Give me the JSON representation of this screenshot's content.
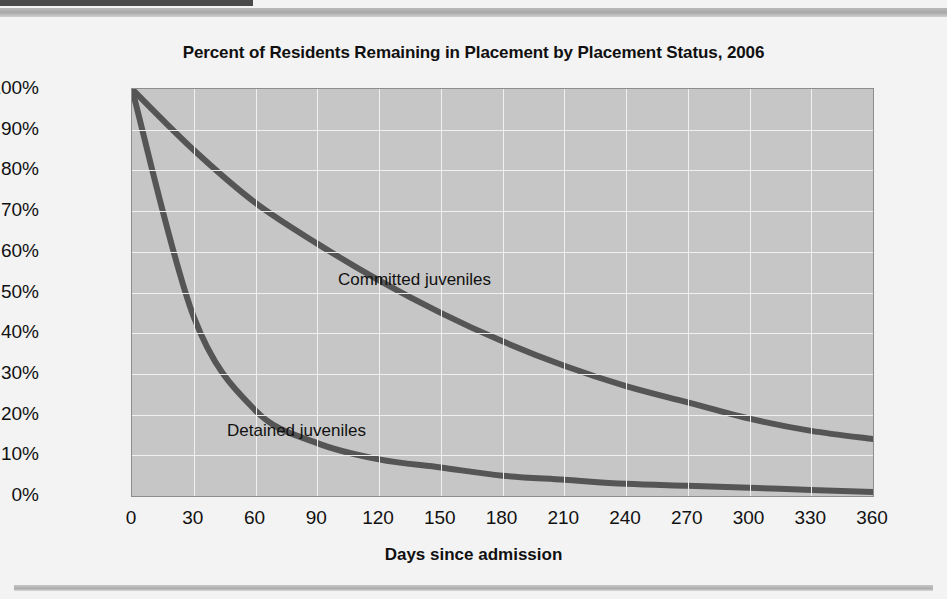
{
  "figure": {
    "title": "Percent of Residents Remaining in Placement by Placement Status, 2006",
    "background_color": "#f3f3f3",
    "plot_background_color": "#c6c6c6",
    "curve_color": "#555555",
    "gridline_color": "#f0f0f0"
  },
  "chart_data": {
    "type": "line",
    "title": "Percent of Residents Remaining in Placement by Placement Status, 2006",
    "xlabel": "Days since admission",
    "ylabel": "",
    "xlim": [
      0,
      360
    ],
    "ylim": [
      0,
      100
    ],
    "grid": true,
    "legend_position": "inline-annotation",
    "x_ticks": [
      0,
      30,
      60,
      90,
      120,
      150,
      180,
      210,
      240,
      270,
      300,
      330,
      360
    ],
    "x_tick_labels": [
      "0",
      "30",
      "60",
      "90",
      "120",
      "150",
      "180",
      "210",
      "240",
      "270",
      "300",
      "330",
      "360"
    ],
    "y_ticks": [
      0,
      10,
      20,
      30,
      40,
      50,
      60,
      70,
      80,
      90,
      100
    ],
    "y_tick_labels": [
      "0%",
      "10%",
      "20%",
      "30%",
      "40%",
      "50%",
      "60%",
      "70%",
      "80%",
      "90%",
      "100%"
    ],
    "x": [
      0,
      30,
      60,
      90,
      120,
      150,
      180,
      210,
      240,
      270,
      300,
      330,
      360
    ],
    "series": [
      {
        "name": "Committed juveniles",
        "label": "Committed juveniles",
        "color": "#555555",
        "values": [
          100,
          85,
          72,
          62,
          53,
          45,
          38,
          32,
          27,
          23,
          19,
          16,
          14
        ]
      },
      {
        "name": "Detained juveniles",
        "label": "Detained juveniles",
        "color": "#555555",
        "values": [
          100,
          44,
          21,
          13,
          9,
          7,
          5,
          4,
          3,
          2.5,
          2,
          1.5,
          1
        ]
      }
    ],
    "annotations": [
      {
        "text": "Committed juveniles",
        "x": 150,
        "y": 56
      },
      {
        "text": "Detained juveniles",
        "x": 95,
        "y": 18
      }
    ]
  }
}
